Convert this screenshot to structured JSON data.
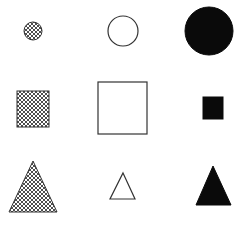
{
  "figure": {
    "width": 248,
    "height": 225,
    "background": "#ffffff",
    "stroke_color": "#333333",
    "fill_black": "#0a0a0a",
    "hatch_color": "#3a3a3a",
    "layout": {
      "rows": 3,
      "cols": 3,
      "row_kinds": [
        "circle",
        "square",
        "triangle"
      ],
      "col_fills": [
        "hatched",
        "outline",
        "solid"
      ]
    },
    "shapes": [
      {
        "id": "circle-hatched-small",
        "kind": "circle",
        "fill": "hatched",
        "size": "small",
        "cx": 33,
        "cy": 31,
        "r": 9
      },
      {
        "id": "circle-outline-medium",
        "kind": "circle",
        "fill": "outline",
        "size": "medium",
        "cx": 123,
        "cy": 31,
        "r": 15
      },
      {
        "id": "circle-solid-large",
        "kind": "circle",
        "fill": "solid",
        "size": "large",
        "cx": 209,
        "cy": 31,
        "r": 24
      },
      {
        "id": "square-hatched-medium",
        "kind": "square",
        "fill": "hatched",
        "size": "medium",
        "x": 17,
        "y": 91,
        "w": 32,
        "h": 36
      },
      {
        "id": "square-outline-large",
        "kind": "square",
        "fill": "outline",
        "size": "large",
        "x": 98,
        "y": 82,
        "w": 49,
        "h": 52
      },
      {
        "id": "square-solid-small",
        "kind": "square",
        "fill": "solid",
        "size": "small",
        "x": 203,
        "y": 97,
        "w": 20,
        "h": 22
      },
      {
        "id": "triangle-hatched-large",
        "kind": "triangle",
        "fill": "hatched",
        "size": "large",
        "points": [
          [
            33,
            161
          ],
          [
            57,
            212
          ],
          [
            9,
            212
          ]
        ]
      },
      {
        "id": "triangle-outline-small",
        "kind": "triangle",
        "fill": "outline",
        "size": "small",
        "points": [
          [
            123,
            173
          ],
          [
            135,
            199
          ],
          [
            110,
            199
          ]
        ]
      },
      {
        "id": "triangle-solid-medium",
        "kind": "triangle",
        "fill": "solid",
        "size": "medium",
        "points": [
          [
            213,
            166
          ],
          [
            231,
            205
          ],
          [
            196,
            205
          ]
        ]
      }
    ]
  }
}
